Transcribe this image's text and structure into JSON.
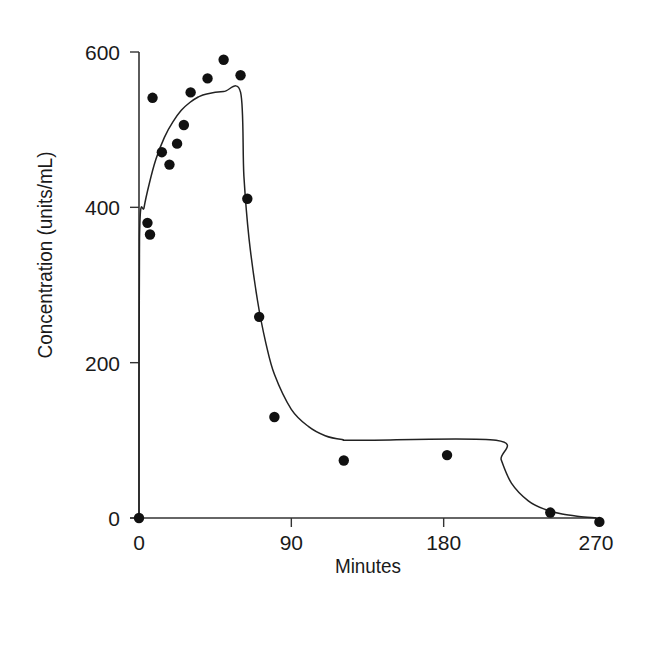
{
  "chart_data": {
    "type": "scatter",
    "title": "",
    "xlabel": "Minutes",
    "ylabel": "Concentration (units/mL)",
    "xlim": [
      0,
      270
    ],
    "ylim": [
      0,
      600
    ],
    "x_ticks": [
      0,
      90,
      180,
      270
    ],
    "y_ticks": [
      0,
      200,
      400,
      600
    ],
    "grid": false,
    "legend": null,
    "series": [
      {
        "name": "observed",
        "type": "scatter",
        "marker": "filled-circle",
        "color": "#111111",
        "points": [
          {
            "x": 0,
            "y": 0
          },
          {
            "x": 5,
            "y": 380
          },
          {
            "x": 6.5,
            "y": 365
          },
          {
            "x": 8,
            "y": 541
          },
          {
            "x": 13.5,
            "y": 471
          },
          {
            "x": 18,
            "y": 455
          },
          {
            "x": 22.5,
            "y": 482
          },
          {
            "x": 26.5,
            "y": 506
          },
          {
            "x": 30.5,
            "y": 548
          },
          {
            "x": 40.5,
            "y": 566
          },
          {
            "x": 50,
            "y": 590
          },
          {
            "x": 60,
            "y": 570
          },
          {
            "x": 64,
            "y": 411
          },
          {
            "x": 71,
            "y": 259
          },
          {
            "x": 80,
            "y": 130
          },
          {
            "x": 121,
            "y": 74
          },
          {
            "x": 182,
            "y": 81
          },
          {
            "x": 243,
            "y": 7
          },
          {
            "x": 272,
            "y": -5
          }
        ]
      },
      {
        "name": "model fit",
        "type": "line",
        "color": "#111111",
        "points": [
          {
            "x": 0,
            "y": 0
          },
          {
            "x": 0.3,
            "y": 360
          },
          {
            "x": 3,
            "y": 400
          },
          {
            "x": 6,
            "y": 430
          },
          {
            "x": 10,
            "y": 462
          },
          {
            "x": 15,
            "y": 490
          },
          {
            "x": 20,
            "y": 510
          },
          {
            "x": 25,
            "y": 525
          },
          {
            "x": 30,
            "y": 535
          },
          {
            "x": 35,
            "y": 542
          },
          {
            "x": 40,
            "y": 546
          },
          {
            "x": 50,
            "y": 549
          },
          {
            "x": 60,
            "y": 548
          },
          {
            "x": 62,
            "y": 440
          },
          {
            "x": 65,
            "y": 360
          },
          {
            "x": 70,
            "y": 280
          },
          {
            "x": 75,
            "y": 225
          },
          {
            "x": 80,
            "y": 185
          },
          {
            "x": 90,
            "y": 140
          },
          {
            "x": 100,
            "y": 118
          },
          {
            "x": 110,
            "y": 106
          },
          {
            "x": 120,
            "y": 101
          },
          {
            "x": 130,
            "y": 100
          },
          {
            "x": 211,
            "y": 100
          },
          {
            "x": 214,
            "y": 75
          },
          {
            "x": 220,
            "y": 45
          },
          {
            "x": 230,
            "y": 22
          },
          {
            "x": 240,
            "y": 11
          },
          {
            "x": 250,
            "y": 5
          },
          {
            "x": 260,
            "y": 2
          },
          {
            "x": 270,
            "y": 0
          }
        ]
      }
    ]
  },
  "labels": {
    "xlabel": "Minutes",
    "ylabel": "Concentration (units/mL)",
    "x_ticks": [
      "0",
      "90",
      "180",
      "270"
    ],
    "y_ticks": [
      "0",
      "200",
      "400",
      "600"
    ]
  }
}
